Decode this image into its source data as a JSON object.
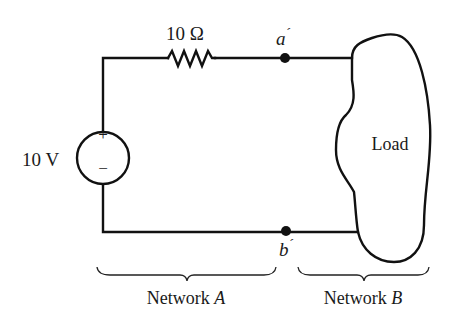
{
  "figure": {
    "resistor": {
      "label": "10 Ω"
    },
    "source": {
      "label": "10 V",
      "plus": "+",
      "minus": "−"
    },
    "terminals": {
      "top": {
        "label": "a",
        "prime": "´"
      },
      "bottom": {
        "label": "b",
        "prime": "´"
      }
    },
    "load": {
      "label": "Load"
    },
    "networks": [
      {
        "name": "Network",
        "letter": "A"
      },
      {
        "name": "Network",
        "letter": "B"
      }
    ]
  }
}
